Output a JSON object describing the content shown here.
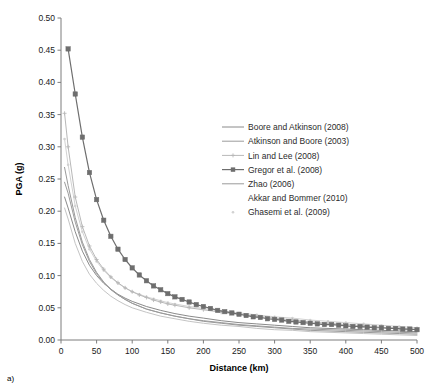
{
  "figure": {
    "panel_label": "a)",
    "background_color": "#ffffff"
  },
  "chart_data": {
    "type": "line",
    "title": "",
    "subtitle": "",
    "xlabel": "Distance (km)",
    "ylabel": "PGA (g)",
    "xlim": [
      0,
      500
    ],
    "ylim": [
      0.0,
      0.5
    ],
    "xticks": [
      0,
      50,
      100,
      150,
      200,
      250,
      300,
      350,
      400,
      450,
      500
    ],
    "xtick_labels": [
      "0",
      "50",
      "100",
      "150",
      "200",
      "250",
      "300",
      "350",
      "400",
      "450",
      "500"
    ],
    "yticks": [
      0.0,
      0.05,
      0.1,
      0.15,
      0.2,
      0.25,
      0.3,
      0.35,
      0.4,
      0.45,
      0.5
    ],
    "ytick_labels": [
      "0.00",
      "0.05",
      "0.10",
      "0.15",
      "0.20",
      "0.25",
      "0.30",
      "0.35",
      "0.40",
      "0.45",
      "0.50"
    ],
    "grid": false,
    "legend_position": "upper-right-inside",
    "series": [
      {
        "name": "Boore and Atkinson (2008)",
        "color": "#8a8a8a",
        "line_width": 1.0,
        "marker": "none",
        "x": [
          5,
          10,
          20,
          30,
          40,
          50,
          60,
          70,
          80,
          90,
          100,
          120,
          140,
          160,
          180,
          200,
          225,
          250,
          275,
          300,
          325,
          350,
          375,
          400,
          425,
          450,
          475,
          500
        ],
        "values": [
          0.222,
          0.205,
          0.168,
          0.138,
          0.116,
          0.1,
          0.088,
          0.079,
          0.071,
          0.065,
          0.06,
          0.052,
          0.046,
          0.041,
          0.037,
          0.034,
          0.03,
          0.027,
          0.025,
          0.023,
          0.021,
          0.019,
          0.018,
          0.017,
          0.016,
          0.015,
          0.014,
          0.013
        ]
      },
      {
        "name": "Atkinson and Boore (2003)",
        "color": "#9c9c9c",
        "line_width": 1.0,
        "marker": "none",
        "x": [
          5,
          10,
          20,
          30,
          40,
          50,
          60,
          70,
          80,
          90,
          100,
          120,
          140,
          160,
          180,
          200,
          225,
          250,
          275,
          300,
          325,
          350,
          375,
          400,
          425,
          450,
          475,
          500
        ],
        "values": [
          0.245,
          0.228,
          0.183,
          0.148,
          0.122,
          0.103,
          0.089,
          0.078,
          0.07,
          0.063,
          0.057,
          0.048,
          0.042,
          0.037,
          0.033,
          0.03,
          0.027,
          0.024,
          0.022,
          0.02,
          0.018,
          0.017,
          0.016,
          0.015,
          0.014,
          0.013,
          0.012,
          0.011
        ]
      },
      {
        "name": "Lin and Lee (2008)",
        "color": "#b8b8b8",
        "line_width": 1.0,
        "marker": "cross",
        "x": [
          5,
          10,
          20,
          30,
          40,
          50,
          60,
          70,
          80,
          90,
          100,
          110,
          120,
          130,
          140,
          150,
          160,
          180,
          200,
          225,
          250,
          275,
          300,
          325,
          350,
          375,
          400,
          425,
          450,
          475,
          500
        ],
        "values": [
          0.352,
          0.3,
          0.222,
          0.176,
          0.146,
          0.125,
          0.11,
          0.098,
          0.089,
          0.081,
          0.075,
          0.07,
          0.066,
          0.062,
          0.059,
          0.056,
          0.054,
          0.05,
          0.047,
          0.043,
          0.04,
          0.037,
          0.034,
          0.031,
          0.028,
          0.026,
          0.024,
          0.022,
          0.02,
          0.018,
          0.016
        ]
      },
      {
        "name": "Gregor et al. (2008)",
        "color": "#6e6e6e",
        "line_width": 1.2,
        "marker": "square",
        "x": [
          10,
          20,
          30,
          40,
          50,
          60,
          70,
          80,
          90,
          100,
          110,
          120,
          130,
          140,
          150,
          160,
          170,
          180,
          190,
          200,
          210,
          220,
          230,
          240,
          250,
          260,
          270,
          280,
          290,
          300,
          310,
          320,
          330,
          340,
          350,
          360,
          370,
          380,
          390,
          400,
          410,
          420,
          430,
          440,
          450,
          460,
          470,
          480,
          490,
          500
        ],
        "values": [
          0.452,
          0.382,
          0.315,
          0.26,
          0.218,
          0.186,
          0.161,
          0.141,
          0.125,
          0.112,
          0.101,
          0.092,
          0.084,
          0.078,
          0.072,
          0.067,
          0.063,
          0.059,
          0.055,
          0.052,
          0.049,
          0.046,
          0.044,
          0.042,
          0.04,
          0.038,
          0.036,
          0.035,
          0.033,
          0.032,
          0.031,
          0.029,
          0.028,
          0.027,
          0.026,
          0.025,
          0.024,
          0.024,
          0.023,
          0.022,
          0.021,
          0.021,
          0.02,
          0.019,
          0.019,
          0.018,
          0.018,
          0.017,
          0.017,
          0.016
        ]
      },
      {
        "name": "Zhao (2006)",
        "color": "#9a9a9a",
        "line_width": 1.0,
        "marker": "none",
        "x": [
          5,
          10,
          20,
          30,
          40,
          50,
          60,
          70,
          80,
          90,
          100,
          120,
          140,
          160,
          180,
          200,
          225,
          250,
          275,
          300,
          325,
          350,
          375,
          400,
          425,
          450,
          475,
          500
        ],
        "values": [
          0.268,
          0.24,
          0.19,
          0.152,
          0.125,
          0.105,
          0.09,
          0.079,
          0.07,
          0.063,
          0.057,
          0.048,
          0.042,
          0.037,
          0.033,
          0.029,
          0.026,
          0.023,
          0.021,
          0.019,
          0.017,
          0.015,
          0.014,
          0.013,
          0.012,
          0.011,
          0.01,
          0.009
        ]
      },
      {
        "name": "Akkar and Bommer (2010)",
        "color": "#c4c4c4",
        "line_width": 1.0,
        "marker": "none",
        "x": [
          5,
          10,
          20,
          30,
          40,
          50,
          60,
          70,
          80,
          90,
          100,
          120,
          140,
          160,
          180,
          200,
          225,
          250,
          275,
          300,
          325,
          350,
          375,
          400,
          425,
          450,
          475,
          500
        ],
        "values": [
          0.205,
          0.188,
          0.15,
          0.122,
          0.102,
          0.088,
          0.077,
          0.068,
          0.061,
          0.055,
          0.05,
          0.043,
          0.037,
          0.033,
          0.029,
          0.026,
          0.023,
          0.021,
          0.018,
          0.016,
          0.015,
          0.013,
          0.012,
          0.011,
          0.01,
          0.009,
          0.008,
          0.007
        ]
      },
      {
        "name": "Ghasemi et al. (2009)",
        "color": "#d2d2d2",
        "line_width": 1.0,
        "marker": "dot",
        "x": [
          5,
          10,
          20,
          30,
          40,
          50,
          60,
          70,
          80,
          90,
          100,
          110,
          120,
          130,
          140,
          150,
          160,
          180,
          200,
          225,
          250,
          275,
          300,
          325,
          350,
          375,
          400,
          425,
          450,
          475,
          500
        ],
        "values": [
          0.312,
          0.272,
          0.208,
          0.168,
          0.141,
          0.122,
          0.108,
          0.097,
          0.088,
          0.081,
          0.075,
          0.071,
          0.067,
          0.064,
          0.061,
          0.058,
          0.056,
          0.052,
          0.049,
          0.045,
          0.042,
          0.039,
          0.036,
          0.034,
          0.031,
          0.029,
          0.027,
          0.025,
          0.023,
          0.021,
          0.019
        ]
      }
    ],
    "legend_entries": [
      {
        "label": "Boore and Atkinson (2008)",
        "color": "#8a8a8a",
        "marker": "none"
      },
      {
        "label": "Atkinson and Boore (2003)",
        "color": "#9c9c9c",
        "marker": "none"
      },
      {
        "label": "Lin and Lee (2008)",
        "color": "#b8b8b8",
        "marker": "cross"
      },
      {
        "label": "Gregor et al. (2008)",
        "color": "#6e6e6e",
        "marker": "square"
      },
      {
        "label": "Zhao (2006)",
        "color": "#9a9a9a",
        "marker": "none"
      },
      {
        "label": "Akkar and Bommer (2010)",
        "color": "#c4c4c4",
        "marker": "none"
      },
      {
        "label": "Ghasemi et al. (2009)",
        "color": "#d2d2d2",
        "marker": "dot"
      }
    ]
  }
}
